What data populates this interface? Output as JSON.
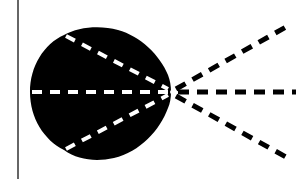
{
  "diagram": {
    "colors": {
      "background": "#ffffff",
      "shape": "#000000",
      "inner_dash": "#ffffff",
      "outer_dash": "#000000",
      "left_line": "#333333"
    },
    "focal_point": {
      "x": 172,
      "y": 92
    },
    "left_line": {
      "x": 18,
      "y1": 0,
      "y2": 179
    },
    "rays": [
      {
        "name": "upper",
        "start": {
          "x": 64,
          "y": 35
        },
        "end": {
          "x": 286,
          "y": 27
        }
      },
      {
        "name": "middle",
        "start": {
          "x": 32,
          "y": 92
        },
        "end": {
          "x": 296,
          "y": 92
        }
      },
      {
        "name": "lower",
        "start": {
          "x": 64,
          "y": 150
        },
        "end": {
          "x": 286,
          "y": 157
        }
      }
    ]
  }
}
